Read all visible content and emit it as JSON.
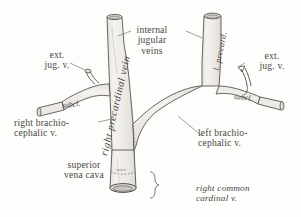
{
  "figure": {
    "domain": "anatomical-line-drawing",
    "background_color": "#fdfdfb",
    "ink_color": "#4a4744",
    "vessel_fill_color": "#f1efec",
    "vessel_shade_color": "#e3e0db",
    "leader_color": "#6a6764"
  },
  "labels": {
    "internal_jugular_veins": "internal\njugular\nveins",
    "right_precardinal_vein": "right precardinal vein",
    "l_precard": "l. precard.",
    "ext_jug_left": "ext.\njug. v.",
    "ext_jug_right": "ext.\njug. v.",
    "subclavian_left": "subcl.",
    "subclavian_right": "subcl.",
    "right_brachiocephalic": "right brachio-\ncephalic v.",
    "left_brachiocephalic": "left brachio-\ncephalic v.",
    "superior_vena_cava": "superior\nvena cava",
    "right_common_cardinal": "right common\ncardinal v."
  },
  "structures": [
    {
      "name": "right-internal-jugular-vein",
      "label_key": "right_precardinal_vein",
      "side": "right"
    },
    {
      "name": "left-internal-jugular-vein",
      "label_key": "l_precard",
      "side": "left"
    },
    {
      "name": "right-external-jugular-vein",
      "label_key": "ext_jug_left",
      "side": "right"
    },
    {
      "name": "left-external-jugular-vein",
      "label_key": "ext_jug_right",
      "side": "left"
    },
    {
      "name": "right-subclavian-vein",
      "label_key": "subclavian_left",
      "side": "right"
    },
    {
      "name": "left-subclavian-vein",
      "label_key": "subclavian_right",
      "side": "left"
    },
    {
      "name": "right-brachiocephalic-vein",
      "label_key": "right_brachiocephalic",
      "side": "right"
    },
    {
      "name": "left-brachiocephalic-vein",
      "label_key": "left_brachiocephalic",
      "side": "left"
    },
    {
      "name": "superior-vena-cava",
      "label_key": "superior_vena_cava",
      "side": "midline"
    },
    {
      "name": "right-common-cardinal-vein",
      "label_key": "right_common_cardinal",
      "side": "right"
    }
  ]
}
